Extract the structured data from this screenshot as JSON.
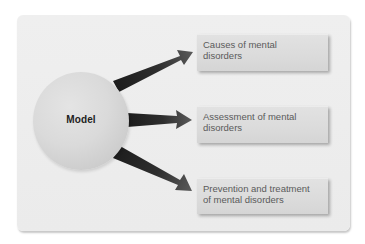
{
  "diagram": {
    "type": "hub-and-spoke",
    "center": {
      "label": "Model",
      "shape": "circle"
    },
    "outcomes": [
      {
        "lines": [
          "Causes of mental",
          "disorders"
        ],
        "full_text": "Causes of mental disorders"
      },
      {
        "lines": [
          "Assessment of mental",
          "disorders"
        ],
        "full_text": "Assessment of mental disorders"
      },
      {
        "lines": [
          "Prevention and treatment",
          "of mental disorders"
        ],
        "full_text": "Prevention and treatment of mental disorders"
      }
    ],
    "edges": [
      {
        "from": "Model",
        "to": "Causes of mental disorders"
      },
      {
        "from": "Model",
        "to": "Assessment of mental disorders"
      },
      {
        "from": "Model",
        "to": "Prevention and treatment of mental disorders"
      }
    ]
  },
  "colors": {
    "panel_background": "#ececec",
    "circle_fill": "#d8d8d8",
    "arrow_dark": "#1e1e1e",
    "arrow_light": "#555555",
    "box_fill": "#dbdbdb",
    "box_text": "#5a5a5a",
    "center_label_text": "#222222"
  }
}
